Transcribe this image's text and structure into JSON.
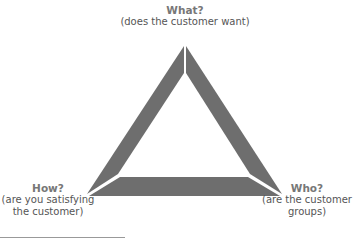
{
  "diagram": {
    "fill_color": "#6e6e6e",
    "nodes": {
      "top": {
        "title": "What?",
        "subtitle": "(does the customer want)"
      },
      "left": {
        "title": "How?",
        "line1": "(are you satisfying",
        "line2": "the customer)"
      },
      "right": {
        "title": "Who?",
        "line1": "(are the customer",
        "line2": "groups)"
      }
    }
  }
}
